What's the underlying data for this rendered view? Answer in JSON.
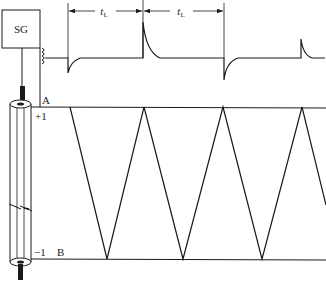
{
  "diagram": {
    "type": "transmission-line-reflection",
    "signal_generator": {
      "label": "SG"
    },
    "nodes": {
      "top": "A",
      "bottom": "B"
    },
    "reflection_coefficients": {
      "top": "+1",
      "bottom": "−1"
    },
    "intervals": [
      {
        "label": "t",
        "subscript": "L"
      },
      {
        "label": "t",
        "subscript": "L"
      }
    ],
    "pulse_waveform": {
      "baseline_y": 58,
      "markers_x": [
        68,
        143,
        224
      ],
      "pulses": [
        {
          "x": 68,
          "polarity": "negative",
          "amplitude": 15
        },
        {
          "x": 143,
          "polarity": "positive",
          "amplitude": 36
        },
        {
          "x": 224,
          "polarity": "negative",
          "amplitude": 22
        },
        {
          "x": 301,
          "polarity": "positive",
          "amplitude": 19
        }
      ]
    },
    "bounce_diagram": {
      "top_y": 107,
      "bottom_y": 259,
      "top_points_x": [
        70,
        144,
        223,
        302
      ],
      "bottom_points_x": [
        107,
        183,
        262
      ]
    }
  },
  "colors": {
    "line": "#1a1a1a",
    "background": "#ffffff"
  }
}
